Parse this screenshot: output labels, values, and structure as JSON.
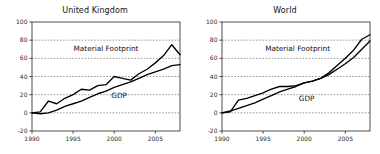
{
  "figure": {
    "background_color": "#ffffff",
    "line_color": "#000000",
    "grid_color": "#6f6f6f",
    "axis_color": "#3a3a3a"
  },
  "chart_data": [
    {
      "type": "line",
      "title": "United Kingdom",
      "xlabel": "",
      "ylabel": "",
      "xlim": [
        1990,
        2008
      ],
      "ylim": [
        -20,
        100
      ],
      "xticks": [
        1990,
        1995,
        2000,
        2005
      ],
      "xticklabels": [
        "1990",
        "1995",
        "2000",
        "2005"
      ],
      "yticks": [
        -20,
        0,
        20,
        40,
        60,
        80,
        100
      ],
      "yticklabels": [
        "-20",
        "0",
        "20",
        "40",
        "60",
        "80",
        "100"
      ],
      "grid": true,
      "legend": "inline-annotations",
      "annotations": [
        {
          "text": "Material Footprint",
          "x": 1999.0,
          "y": 68
        },
        {
          "text": "GDP",
          "x": 2000.6,
          "y": 16
        }
      ],
      "x": [
        1990,
        1991,
        1992,
        1993,
        1994,
        1995,
        1996,
        1997,
        1998,
        1999,
        2000,
        2001,
        2002,
        2003,
        2004,
        2005,
        2006,
        2007,
        2008
      ],
      "series": [
        {
          "name": "Material Footprint",
          "values": [
            0,
            1,
            13,
            10,
            16,
            20,
            26,
            25,
            30,
            31,
            40,
            38,
            36,
            43,
            48,
            55,
            63,
            75,
            64
          ]
        },
        {
          "name": "GDP",
          "values": [
            0,
            -1,
            0,
            3,
            7,
            10,
            13,
            17,
            21,
            24,
            28,
            31,
            34,
            38,
            42,
            45,
            48,
            52,
            53
          ]
        }
      ]
    },
    {
      "type": "line",
      "title": "World",
      "xlabel": "",
      "ylabel": "",
      "xlim": [
        1990,
        2008
      ],
      "ylim": [
        -20,
        100
      ],
      "xticks": [
        1990,
        1995,
        2000,
        2005
      ],
      "xticklabels": [
        "1990",
        "1995",
        "2000",
        "2005"
      ],
      "yticks": [
        -20,
        0,
        20,
        40,
        60,
        80,
        100
      ],
      "yticklabels": [
        "-20",
        "0",
        "20",
        "40",
        "60",
        "80",
        "100"
      ],
      "grid": true,
      "legend": "inline-annotations",
      "annotations": [
        {
          "text": "Material Footprint",
          "x": 1999.2,
          "y": 68
        },
        {
          "text": "GDP",
          "x": 2000.3,
          "y": 13
        }
      ],
      "x": [
        1990,
        1991,
        1992,
        1993,
        1994,
        1995,
        1996,
        1997,
        1998,
        1999,
        2000,
        2001,
        2002,
        2003,
        2004,
        2005,
        2006,
        2007,
        2008
      ],
      "series": [
        {
          "name": "Material Footprint",
          "values": [
            0,
            1,
            14,
            16,
            19,
            22,
            26,
            29,
            29,
            30,
            33,
            35,
            38,
            44,
            52,
            60,
            69,
            81,
            86
          ]
        },
        {
          "name": "GDP",
          "values": [
            0,
            2,
            5,
            8,
            11,
            15,
            19,
            23,
            26,
            29,
            33,
            35,
            38,
            42,
            48,
            54,
            61,
            70,
            79
          ]
        }
      ]
    }
  ]
}
